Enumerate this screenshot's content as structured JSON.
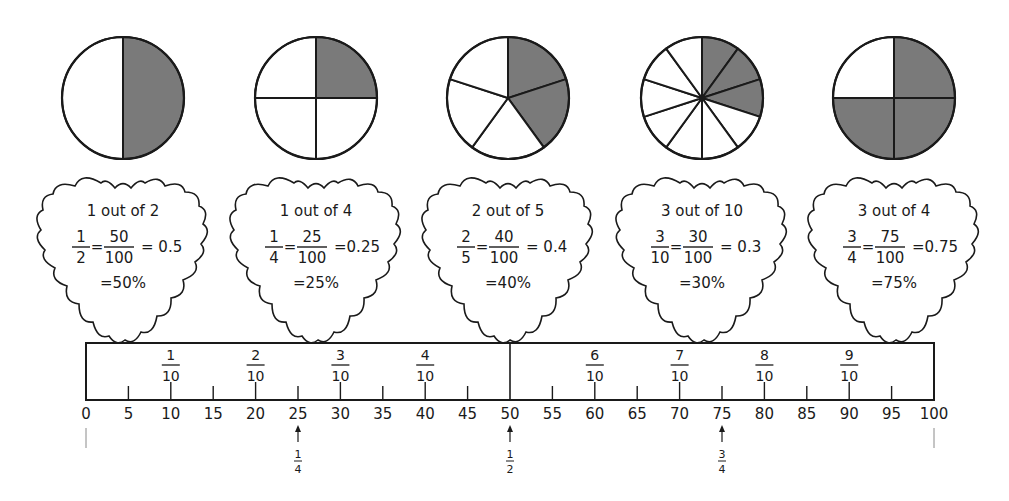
{
  "pies": [
    {
      "id": "half",
      "cx": 123,
      "cy": 98,
      "r": 61,
      "slices": 2,
      "shaded": [
        0
      ],
      "numerator": 1,
      "denominator": 2
    },
    {
      "id": "quarter",
      "cx": 316,
      "cy": 98,
      "r": 61,
      "slices": 4,
      "shaded": [
        0
      ],
      "numerator": 1,
      "denominator": 4
    },
    {
      "id": "two-fifths",
      "cx": 508,
      "cy": 98,
      "r": 61,
      "slices": 5,
      "shaded": [
        0,
        1
      ],
      "numerator": 2,
      "denominator": 5
    },
    {
      "id": "three-tenths",
      "cx": 702,
      "cy": 98,
      "r": 61,
      "slices": 10,
      "shaded": [
        0,
        1,
        2
      ],
      "numerator": 3,
      "denominator": 10
    },
    {
      "id": "three-quarters",
      "cx": 894,
      "cy": 98,
      "r": 61,
      "slices": 4,
      "shaded": [
        0,
        1,
        2
      ],
      "numerator": 3,
      "denominator": 4
    }
  ],
  "colors": {
    "shade": "#7a7a7a",
    "ink": "#1a1a1a",
    "guide": "#8a8a8a"
  },
  "clouds": [
    {
      "cx": 123,
      "title": "1 out of 2",
      "frac_n": "1",
      "frac_d": "2",
      "hund_n": "50",
      "hund_d": "100",
      "decimal": "= 0.5",
      "percent": "=50%"
    },
    {
      "cx": 316,
      "title": "1 out of 4",
      "frac_n": "1",
      "frac_d": "4",
      "hund_n": "25",
      "hund_d": "100",
      "decimal": "=0.25",
      "percent": "=25%"
    },
    {
      "cx": 508,
      "title": "2 out of 5",
      "frac_n": "2",
      "frac_d": "5",
      "hund_n": "40",
      "hund_d": "100",
      "decimal": "= 0.4",
      "percent": "=40%"
    },
    {
      "cx": 702,
      "title": "3 out of 10",
      "frac_n": "3",
      "frac_d": "10",
      "hund_n": "30",
      "hund_d": "100",
      "decimal": "= 0.3",
      "percent": "=30%"
    },
    {
      "cx": 894,
      "title": "3 out of 4",
      "frac_n": "3",
      "frac_d": "4",
      "hund_n": "75",
      "hund_d": "100",
      "decimal": "=0.75",
      "percent": "=75%"
    }
  ],
  "number_line": {
    "x0": 86,
    "x1": 934,
    "top": 343,
    "bottom": 400,
    "ticks": [
      "0",
      "5",
      "10",
      "15",
      "20",
      "25",
      "30",
      "35",
      "40",
      "45",
      "50",
      "55",
      "60",
      "65",
      "70",
      "75",
      "80",
      "85",
      "90",
      "95",
      "100"
    ],
    "tenths": [
      {
        "value": 10,
        "n": "1",
        "d": "10"
      },
      {
        "value": 20,
        "n": "2",
        "d": "10"
      },
      {
        "value": 30,
        "n": "3",
        "d": "10"
      },
      {
        "value": 40,
        "n": "4",
        "d": "10"
      },
      {
        "value": 60,
        "n": "6",
        "d": "10"
      },
      {
        "value": 70,
        "n": "7",
        "d": "10"
      },
      {
        "value": 80,
        "n": "8",
        "d": "10"
      },
      {
        "value": 90,
        "n": "9",
        "d": "10"
      }
    ],
    "markers": [
      {
        "value": 25,
        "n": "1",
        "d": "4"
      },
      {
        "value": 50,
        "n": "1",
        "d": "2"
      },
      {
        "value": 75,
        "n": "3",
        "d": "4"
      }
    ]
  }
}
